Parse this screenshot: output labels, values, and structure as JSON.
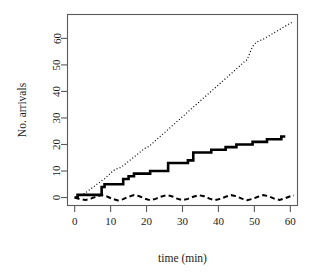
{
  "chart_data": {
    "type": "line",
    "title": "",
    "xlabel": "time (min)",
    "ylabel": "No. arrivals",
    "xlim": [
      -2,
      62
    ],
    "ylim": [
      -3,
      69
    ],
    "xticks": [
      0,
      10,
      20,
      30,
      40,
      50,
      60
    ],
    "xtick_labels": [
      "0",
      "10",
      "20",
      "30",
      "40",
      "50",
      "60"
    ],
    "yticks": [
      0,
      10,
      20,
      30,
      40,
      50,
      60
    ],
    "ytick_labels": [
      "0",
      "10",
      "20",
      "30",
      "40",
      "50",
      "60"
    ],
    "grid": false,
    "legend": "none",
    "box": true,
    "series": [
      {
        "name": "cumulative-arrivals-dotted",
        "style": "dotted",
        "color": "#000000",
        "width": 1.2,
        "points": [
          [
            0.0,
            0.0
          ],
          [
            0.6,
            0.3
          ],
          [
            1.2,
            0.6
          ],
          [
            1.8,
            0.8
          ],
          [
            2.4,
            1.2
          ],
          [
            3.0,
            1.8
          ],
          [
            3.6,
            2.4
          ],
          [
            4.2,
            3.0
          ],
          [
            4.8,
            3.6
          ],
          [
            5.4,
            4.2
          ],
          [
            6.0,
            4.8
          ],
          [
            6.8,
            5.6
          ],
          [
            7.6,
            6.4
          ],
          [
            8.4,
            7.2
          ],
          [
            9.2,
            8.2
          ],
          [
            10.0,
            9.2
          ],
          [
            10.8,
            10.2
          ],
          [
            11.6,
            10.8
          ],
          [
            12.4,
            11.0
          ],
          [
            13.5,
            12.0
          ],
          [
            14.6,
            13.2
          ],
          [
            15.7,
            14.4
          ],
          [
            16.8,
            15.6
          ],
          [
            17.9,
            16.8
          ],
          [
            19.0,
            18.0
          ],
          [
            19.8,
            18.8
          ],
          [
            20.6,
            19.2
          ],
          [
            21.6,
            20.4
          ],
          [
            22.6,
            21.6
          ],
          [
            23.6,
            22.8
          ],
          [
            24.6,
            24.0
          ],
          [
            25.6,
            25.2
          ],
          [
            26.6,
            26.4
          ],
          [
            27.6,
            27.6
          ],
          [
            28.6,
            28.8
          ],
          [
            29.6,
            30.0
          ],
          [
            30.6,
            31.2
          ],
          [
            31.6,
            32.4
          ],
          [
            32.6,
            33.6
          ],
          [
            33.6,
            34.8
          ],
          [
            34.6,
            36.0
          ],
          [
            35.6,
            37.2
          ],
          [
            36.6,
            38.4
          ],
          [
            37.6,
            39.6
          ],
          [
            38.6,
            40.8
          ],
          [
            39.6,
            42.0
          ],
          [
            40.6,
            43.2
          ],
          [
            41.6,
            44.4
          ],
          [
            42.6,
            45.6
          ],
          [
            43.6,
            46.8
          ],
          [
            44.6,
            48.0
          ],
          [
            45.6,
            49.2
          ],
          [
            46.4,
            50.2
          ],
          [
            47.2,
            51.2
          ],
          [
            48.0,
            52.0
          ],
          [
            48.6,
            54.0
          ],
          [
            49.2,
            56.0
          ],
          [
            49.8,
            57.5
          ],
          [
            50.6,
            58.6
          ],
          [
            51.6,
            59.2
          ],
          [
            52.6,
            59.8
          ],
          [
            53.6,
            60.6
          ],
          [
            54.6,
            61.4
          ],
          [
            55.6,
            62.2
          ],
          [
            56.6,
            63.0
          ],
          [
            57.6,
            63.8
          ],
          [
            58.6,
            64.6
          ],
          [
            59.6,
            65.4
          ],
          [
            60.4,
            66.0
          ]
        ]
      },
      {
        "name": "observed-arrivals-step",
        "style": "solid",
        "color": "#000000",
        "width": 2.6,
        "points": [
          [
            0.0,
            0.0
          ],
          [
            0.8,
            0.0
          ],
          [
            0.8,
            1.0
          ],
          [
            7.5,
            1.0
          ],
          [
            7.5,
            4.0
          ],
          [
            8.3,
            4.0
          ],
          [
            8.3,
            5.0
          ],
          [
            13.5,
            5.0
          ],
          [
            13.5,
            7.0
          ],
          [
            15.0,
            7.0
          ],
          [
            15.0,
            8.0
          ],
          [
            16.5,
            8.0
          ],
          [
            16.5,
            9.0
          ],
          [
            21.0,
            9.0
          ],
          [
            21.0,
            10.0
          ],
          [
            26.0,
            10.0
          ],
          [
            26.0,
            13.0
          ],
          [
            31.5,
            13.0
          ],
          [
            31.5,
            14.0
          ],
          [
            33.0,
            14.0
          ],
          [
            33.0,
            17.0
          ],
          [
            38.0,
            17.0
          ],
          [
            38.0,
            18.0
          ],
          [
            42.0,
            18.0
          ],
          [
            42.0,
            19.0
          ],
          [
            45.0,
            19.0
          ],
          [
            45.0,
            20.0
          ],
          [
            49.5,
            20.0
          ],
          [
            49.5,
            21.0
          ],
          [
            53.5,
            21.0
          ],
          [
            53.5,
            22.0
          ],
          [
            57.5,
            22.0
          ],
          [
            57.5,
            23.0
          ],
          [
            58.6,
            23.0
          ]
        ]
      },
      {
        "name": "residual-dashed",
        "style": "dashed",
        "color": "#000000",
        "width": 2.0,
        "points": [
          [
            0.0,
            0.0
          ],
          [
            1.5,
            -0.6
          ],
          [
            3.0,
            -0.9
          ],
          [
            4.5,
            -0.4
          ],
          [
            6.0,
            0.4
          ],
          [
            7.5,
            0.9
          ],
          [
            9.0,
            0.4
          ],
          [
            10.5,
            -0.5
          ],
          [
            12.0,
            -1.1
          ],
          [
            13.5,
            -0.6
          ],
          [
            15.0,
            0.3
          ],
          [
            16.5,
            0.9
          ],
          [
            18.0,
            0.5
          ],
          [
            19.5,
            -0.4
          ],
          [
            21.0,
            -1.0
          ],
          [
            22.5,
            -0.5
          ],
          [
            24.0,
            0.3
          ],
          [
            25.5,
            0.9
          ],
          [
            27.0,
            0.5
          ],
          [
            28.5,
            -0.4
          ],
          [
            30.0,
            -1.0
          ],
          [
            31.5,
            -0.5
          ],
          [
            33.0,
            0.3
          ],
          [
            34.5,
            0.9
          ],
          [
            36.0,
            0.5
          ],
          [
            37.5,
            -0.4
          ],
          [
            39.0,
            -1.0
          ],
          [
            40.5,
            -0.5
          ],
          [
            42.0,
            0.3
          ],
          [
            43.5,
            0.9
          ],
          [
            45.0,
            0.5
          ],
          [
            46.5,
            -0.4
          ],
          [
            48.0,
            -1.0
          ],
          [
            49.5,
            -0.5
          ],
          [
            51.0,
            0.3
          ],
          [
            52.5,
            0.9
          ],
          [
            54.0,
            0.5
          ],
          [
            55.5,
            -0.4
          ],
          [
            57.0,
            -0.9
          ],
          [
            58.5,
            -0.3
          ],
          [
            60.0,
            0.5
          ],
          [
            61.0,
            0.8
          ]
        ]
      }
    ]
  }
}
